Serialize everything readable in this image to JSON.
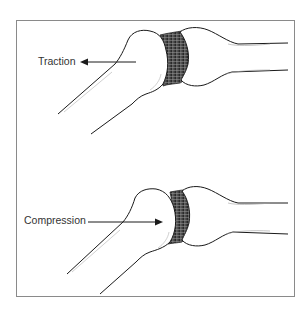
{
  "diagram": {
    "panels": [
      {
        "id": "traction",
        "label": "Traction",
        "arrow_direction": "left"
      },
      {
        "id": "compression",
        "label": "Compression",
        "arrow_direction": "right"
      }
    ],
    "colors": {
      "outline": "#1a1a1a",
      "cartilage": "#4a4a4a",
      "frame": "#8a8a8a",
      "background": "#ffffff"
    }
  }
}
